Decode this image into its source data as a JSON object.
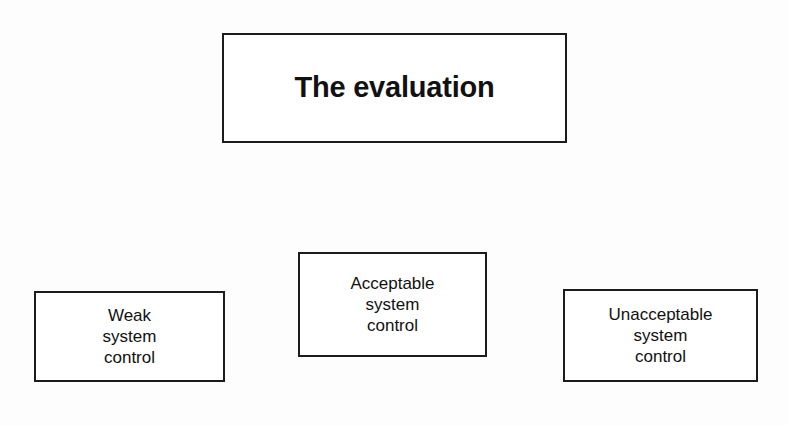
{
  "slide": {
    "background_color": "#fdfdfd",
    "title_box": {
      "text": "The evaluation"
    },
    "outcome_boxes": [
      {
        "name": "weak",
        "text": "Weak\nsystem\ncontrol"
      },
      {
        "name": "acceptable",
        "text": "Acceptable\nsystem\ncontrol"
      },
      {
        "name": "unacceptable",
        "text": "Unacceptable\nsystem\ncontrol"
      }
    ],
    "style": {
      "box_fill": "#ffffff",
      "box_border_color": "#1c1c1c",
      "shadow_color": "#9b9b9b",
      "text_color": "#111111"
    }
  }
}
